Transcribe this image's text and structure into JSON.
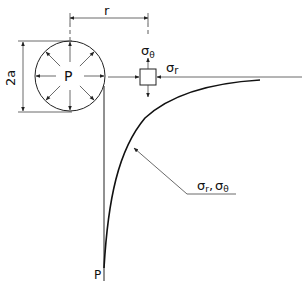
{
  "diagram": {
    "labels": {
      "radius_dimension": "r",
      "diameter_dimension": "2a",
      "internal_pressure": "P",
      "sigma_theta_symbol": "σ",
      "sigma_theta_subscript": "θ",
      "sigma_r_symbol": "σ",
      "sigma_r_subscript": "r",
      "curve_label_sigma_r": "σ",
      "curve_label_sigma_r_sub": "r",
      "curve_label_separator": ",",
      "curve_label_sigma_theta": "σ",
      "curve_label_sigma_theta_sub": "θ",
      "axis_origin_value": "P"
    },
    "components": [
      "circular hole with radial pressure arrows",
      "stress element (square) at distance r",
      "radial distance axis",
      "stress decay curve"
    ]
  }
}
